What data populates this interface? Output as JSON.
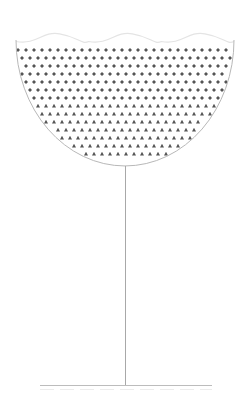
{
  "figure": {
    "width": 239,
    "height": 403,
    "background": "#ffffff",
    "colors": {
      "outline": "#b8b8b8",
      "wave": "#e4e4e4",
      "dot": "#555555",
      "stem": "#a8a8a8",
      "ground": "#bcbcbc",
      "reflection": "#ececec"
    },
    "bowl": {
      "center_x": 125,
      "top_y": 40,
      "left_x": 16,
      "right_x": 234,
      "bottom_y": 166
    },
    "wave_top": {
      "y": 38,
      "amplitude": 7,
      "crests": 3
    },
    "pattern": {
      "start_y": 50,
      "row_spacing": 8,
      "col_spacing": 8,
      "diamond_rows": 7,
      "triangle_rows": 7,
      "first_col_x": 18
    },
    "stem": {
      "x": 125,
      "top_y": 166,
      "bottom_y": 385
    },
    "ground": {
      "y": 385,
      "left_x": 40,
      "right_x": 212
    }
  }
}
